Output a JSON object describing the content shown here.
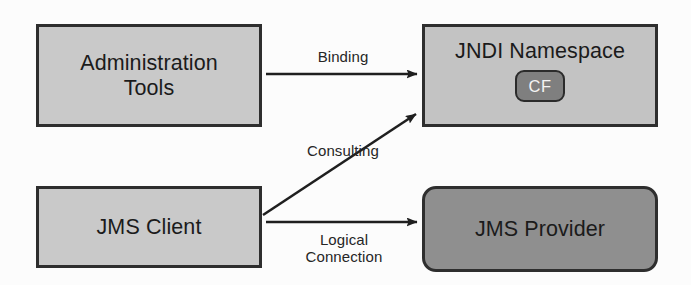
{
  "diagram": {
    "colors": {
      "background": "#fcfcfc",
      "node_fill_light": "#c9c9c9",
      "node_fill_medium": "#c3c3c3",
      "node_fill_dark": "#8f8f8f",
      "badge_fill": "#7f7f7f",
      "stroke": "#2e2e2e",
      "text": "#1b1b1b",
      "badge_text": "#f4f4f4"
    },
    "nodes": [
      {
        "id": "admin-tools",
        "label": "Administration\nTools",
        "shape": "rectangle",
        "fill": "#c9c9c9"
      },
      {
        "id": "jndi-namespace",
        "label": "JNDI Namespace",
        "shape": "rectangle",
        "fill": "#c3c3c3",
        "badge": "CF"
      },
      {
        "id": "jms-client",
        "label": "JMS Client",
        "shape": "rectangle",
        "fill": "#c9c9c9"
      },
      {
        "id": "jms-provider",
        "label": "JMS Provider",
        "shape": "rounded-rectangle",
        "fill": "#8f8f8f"
      }
    ],
    "edges": [
      {
        "id": "binding",
        "label": "Binding",
        "from": "admin-tools",
        "to": "jndi-namespace",
        "style": "solid-arrow",
        "direction": "horizontal"
      },
      {
        "id": "consulting",
        "label": "Consulting",
        "from": "jms-client",
        "to": "jndi-namespace",
        "style": "solid-arrow",
        "direction": "diagonal-up"
      },
      {
        "id": "logical-connection",
        "label": "Logical\nConnection",
        "from": "jms-client",
        "to": "jms-provider",
        "style": "solid-arrow",
        "direction": "horizontal"
      }
    ]
  }
}
